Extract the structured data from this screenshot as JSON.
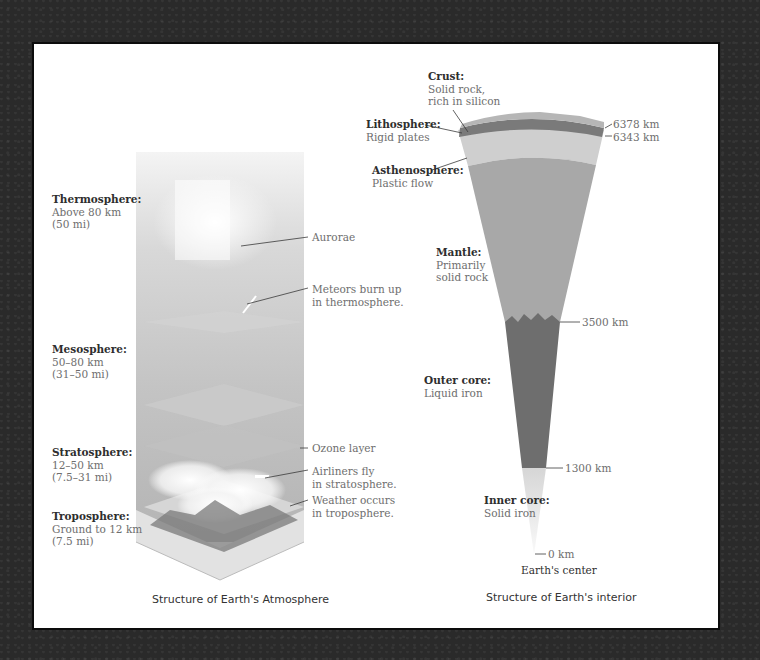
{
  "atmosphere": {
    "caption": "Structure of Earth's Atmosphere",
    "layers": [
      {
        "name": "Thermosphere:",
        "range": "Above 80 km",
        "alt": "(50 mi)"
      },
      {
        "name": "Mesosphere:",
        "range": "50–80 km",
        "alt": "(31–50 mi)"
      },
      {
        "name": "Stratosphere:",
        "range": "12–50 km",
        "alt": "(7.5–31 mi)"
      },
      {
        "name": "Troposphere:",
        "range": "Ground to 12 km",
        "alt": "(7.5 mi)"
      }
    ],
    "callouts": [
      {
        "line1": "Aurorae",
        "line2": ""
      },
      {
        "line1": "Meteors burn up",
        "line2": "in thermosphere."
      },
      {
        "line1": "Ozone layer",
        "line2": ""
      },
      {
        "line1": "Airliners fly",
        "line2": "in stratosphere."
      },
      {
        "line1": "Weather occurs",
        "line2": "in troposphere."
      }
    ]
  },
  "interior": {
    "caption": "Structure of Earth's interior",
    "layers": [
      {
        "name": "Crust:",
        "line1": "Solid rock,",
        "line2": "rich in silicon"
      },
      {
        "name": "Lithosphere:",
        "line1": "Rigid plates",
        "line2": ""
      },
      {
        "name": "Asthenosphere:",
        "line1": "Plastic flow",
        "line2": ""
      },
      {
        "name": "Mantle:",
        "line1": "Primarily",
        "line2": "solid rock"
      },
      {
        "name": "Outer core:",
        "line1": "Liquid iron",
        "line2": ""
      },
      {
        "name": "Inner core:",
        "line1": "Solid iron",
        "line2": ""
      }
    ],
    "depths": [
      "6378 km",
      "6343 km",
      "3500 km",
      "1300 km",
      "0 km"
    ],
    "center_label": "Earth's center"
  }
}
